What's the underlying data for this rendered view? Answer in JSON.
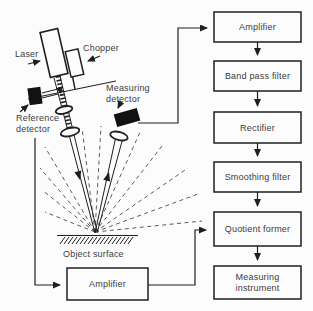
{
  "diagram": {
    "title_hint": "Laser scattering measurement system block diagram",
    "boxes": {
      "amplifier_top": "Amplifier",
      "band_pass_filter": "Band pass filter",
      "rectifier": "Rectifier",
      "smoothing_filter": "Smoothing filter",
      "quotient_former": "Quotient former",
      "measuring_instrument_line1": "Measuring",
      "measuring_instrument_line2": "instrument",
      "amplifier_bottom": "Amplifier"
    },
    "labels": {
      "laser": "Laser",
      "chopper": "Chopper",
      "measuring_detector_line1": "Measuring",
      "measuring_detector_line2": "detector",
      "reference_detector_line1": "Reference",
      "reference_detector_line2": "detector",
      "object_surface": "Object surface"
    },
    "colors": {
      "line": "#1f1f1f",
      "text": "#3c3c3c",
      "detector_fill": "#121212",
      "background": "#fcfcfc"
    }
  }
}
